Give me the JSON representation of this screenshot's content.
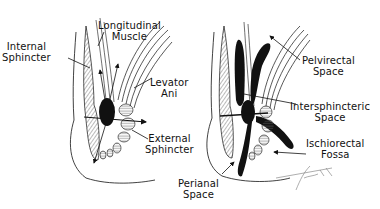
{
  "figure": {
    "left_panel": {
      "title": "anal canal musculature",
      "labels": [
        {
          "id": "internal-sphincter",
          "lines": [
            "Internal",
            "Sphincter"
          ]
        },
        {
          "id": "longitudinal-muscle",
          "lines": [
            "Longitudinal",
            "Muscle"
          ]
        },
        {
          "id": "levator-ani",
          "lines": [
            "Levator",
            "Ani"
          ]
        },
        {
          "id": "external-sphincter",
          "lines": [
            "External",
            "Sphincter"
          ]
        }
      ]
    },
    "right_panel": {
      "title": "anorectal spaces",
      "labels": [
        {
          "id": "pelvirectal-space",
          "lines": [
            "Pelvirectal",
            "Space"
          ]
        },
        {
          "id": "intersphincteric-space",
          "lines": [
            "Intersphincteric",
            "Space"
          ]
        },
        {
          "id": "ischiorectal-fossa",
          "lines": [
            "Ischiorectal",
            "Fossa"
          ]
        },
        {
          "id": "perianal-space",
          "lines": [
            "Perianal",
            "Space"
          ]
        }
      ]
    },
    "signature": "Frank '79",
    "colors": {
      "ink": "#111111",
      "hatch": "#555555",
      "muscle_fill": "#d8d8d8",
      "background": "#ffffff"
    }
  }
}
